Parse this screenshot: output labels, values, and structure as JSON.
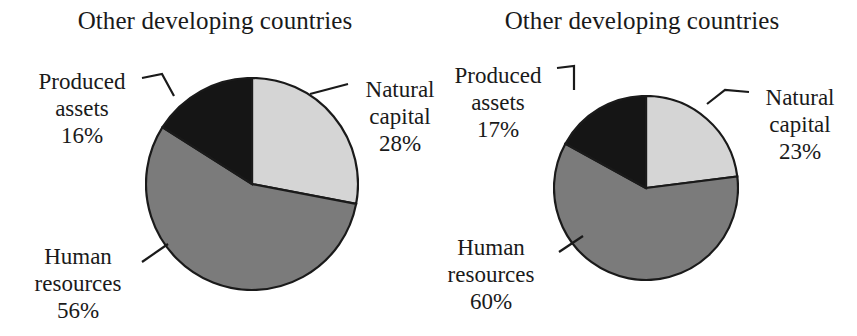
{
  "figure": {
    "background": "#ffffff",
    "width": 857,
    "height": 336
  },
  "palette": {
    "natural_capital": "#d5d5d5",
    "human_resources": "#7b7b7b",
    "produced_assets": "#151515",
    "outline": "#1a1a1a",
    "text": "#1a1a1a"
  },
  "panels": [
    {
      "id": "left",
      "title": "Other developing countries",
      "labels": {
        "produced_name_line1": "Produced",
        "produced_name_line2": "assets",
        "produced_value": "16%",
        "natural_name_line1": "Natural",
        "natural_name_line2": "capital",
        "natural_value": "28%",
        "human_name_line1": "Human",
        "human_name_line2": "resources",
        "human_value": "56%"
      }
    },
    {
      "id": "right",
      "title": "Other developing countries",
      "labels": {
        "produced_name_line1": "Produced",
        "produced_name_line2": "assets",
        "produced_value": "17%",
        "natural_name_line1": "Natural",
        "natural_name_line2": "capital",
        "natural_value": "23%",
        "human_name_line1": "Human",
        "human_name_line2": "resources",
        "human_value": "60%"
      }
    }
  ],
  "chart_data": [
    {
      "type": "pie",
      "title": "Other developing countries",
      "subtitle": "",
      "xlabel": "",
      "ylabel": "",
      "legend": "none (direct labels with leader lines)",
      "start_angle_deg": 0,
      "direction": "clockwise",
      "units": "percent",
      "total": 100,
      "categories": [
        "Natural capital",
        "Human resources",
        "Produced assets"
      ],
      "values": [
        28,
        56,
        16
      ],
      "colors": [
        "#d5d5d5",
        "#7b7b7b",
        "#151515"
      ],
      "labels": [
        "Natural capital 28%",
        "Human resources 56%",
        "Produced assets 16%"
      ]
    },
    {
      "type": "pie",
      "title": "Other developing countries",
      "subtitle": "",
      "xlabel": "",
      "ylabel": "",
      "legend": "none (direct labels with leader lines)",
      "start_angle_deg": 0,
      "direction": "clockwise",
      "units": "percent",
      "total": 100,
      "categories": [
        "Natural capital",
        "Human resources",
        "Produced assets"
      ],
      "values": [
        23,
        60,
        17
      ],
      "colors": [
        "#d5d5d5",
        "#7b7b7b",
        "#151515"
      ],
      "labels": [
        "Natural capital 23%",
        "Human resources 60%",
        "Produced assets 17%"
      ]
    }
  ]
}
